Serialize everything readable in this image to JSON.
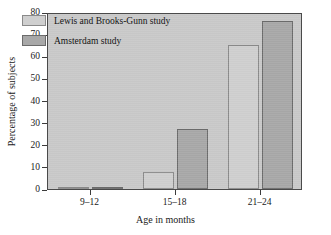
{
  "chart_data": {
    "type": "bar",
    "title": "",
    "subtitle": "",
    "xlabel": "Age in months",
    "ylabel": "Percentage of subjects",
    "categories": [
      "9–12",
      "15–18",
      "21–24"
    ],
    "series": [
      {
        "name": "Lewis and Brooks-Gunn study",
        "color": "#cfcfcf",
        "values": [
          1,
          7.5,
          65
        ]
      },
      {
        "name": "Amsterdam study",
        "color": "#a8a8a8",
        "values": [
          1,
          27,
          76
        ]
      }
    ],
    "ylim": [
      0,
      80
    ],
    "yticks": [
      0,
      10,
      20,
      30,
      40,
      50,
      60,
      70,
      80
    ],
    "ytick_labels": [
      "0",
      "10",
      "20",
      "30",
      "40",
      "50",
      "60",
      "70",
      "80"
    ],
    "grid": false,
    "legend_position": "upper-left",
    "plot_background": "#c9c9c9",
    "frame_color": "#4a4a4a"
  },
  "legend": {
    "entries": [
      {
        "label": "Lewis and Brooks-Gunn study",
        "swatch": "light"
      },
      {
        "label": "Amsterdam study",
        "swatch": "dark"
      }
    ]
  },
  "axes": {
    "x_title": "Age in months",
    "y_title": "Percentage of subjects"
  }
}
